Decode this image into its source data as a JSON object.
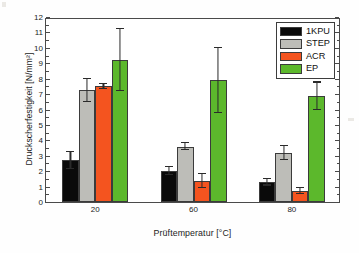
{
  "chart_data": {
    "type": "bar",
    "title": "",
    "subtitle": "",
    "xlabel": "Prüftemperatur [°C]",
    "ylabel": "Druckscherfestigkeit [N/mm²]",
    "categories": [
      "20",
      "60",
      "80"
    ],
    "ylim": [
      0,
      12
    ],
    "ytick_step": 1,
    "ytick_labels": [
      "0",
      "1",
      "2",
      "3",
      "4",
      "5",
      "6",
      "7",
      "8",
      "9",
      "10",
      "11",
      "12"
    ],
    "grid": false,
    "legend_position": "top-right",
    "error_bars": "symmetric",
    "series": [
      {
        "name": "1KPU",
        "color": "#0a0a0a",
        "values": [
          2.7,
          2.0,
          1.27
        ],
        "errors": [
          0.55,
          0.25,
          0.2
        ]
      },
      {
        "name": "STEP",
        "color": "#bdbdb8",
        "values": [
          7.25,
          3.6,
          3.2
        ],
        "errors": [
          0.75,
          0.2,
          0.45
        ]
      },
      {
        "name": "ACR",
        "color": "#f4541f",
        "values": [
          7.5,
          1.35,
          0.73
        ],
        "errors": [
          0.15,
          0.45,
          0.2
        ]
      },
      {
        "name": "EP",
        "color": "#5cb82c",
        "values": [
          9.2,
          7.9,
          6.85
        ],
        "errors": [
          2.0,
          2.1,
          0.9
        ]
      }
    ]
  },
  "legend": {
    "items": [
      {
        "label": "1KPU",
        "color": "#0a0a0a"
      },
      {
        "label": "STEP",
        "color": "#bdbdb8"
      },
      {
        "label": "ACR",
        "color": "#f4541f"
      },
      {
        "label": "EP",
        "color": "#5cb82c"
      }
    ]
  },
  "axes": {
    "x_title": "Prüftemperatur [°C]",
    "y_title": "Druckscherfestigkeit [N/mm²]",
    "x_tick_labels": [
      "20",
      "60",
      "80"
    ],
    "y_tick_labels": [
      "0",
      "1",
      "2",
      "3",
      "4",
      "5",
      "6",
      "7",
      "8",
      "9",
      "10",
      "11",
      "12"
    ]
  },
  "colors": {
    "frame": "#4a4a4a",
    "background": "#ffffff",
    "text": "#1c1c1c",
    "series_1kpu": "#0a0a0a",
    "series_step": "#bdbdb8",
    "series_acr": "#f4541f",
    "series_ep": "#5cb82c"
  }
}
